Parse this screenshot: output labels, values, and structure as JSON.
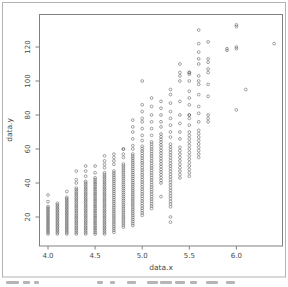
{
  "colors": {
    "point_stroke": "#5a5a5a",
    "axis_line": "#808080",
    "tick_text": "#4a4a4a",
    "outer_border": "#b3b3b3",
    "background": "#ffffff"
  },
  "footer": {
    "caption_cropped": true
  },
  "chart_data": {
    "type": "scatter",
    "title": "",
    "xlabel": "data.x",
    "ylabel": "data.y",
    "marker": "open-circle",
    "grid": false,
    "legend": "none",
    "xlim": [
      3.9,
      6.5
    ],
    "ylim": [
      3,
      139
    ],
    "x_ticks": [
      4.0,
      4.5,
      5.0,
      5.5,
      6.0
    ],
    "x_tick_labels": [
      "4.0",
      "4.5",
      "5.0",
      "5.5",
      "6.0"
    ],
    "y_ticks": [
      20,
      40,
      60,
      80,
      100,
      120
    ],
    "y_tick_labels": [
      "20",
      "40",
      "60",
      "80",
      "100",
      "120"
    ],
    "columns_note": "dense_range = overplotted vertical run of points sampled every `step` y-units; points = individually visible points",
    "columns": [
      {
        "x": 4.0,
        "dense_range": [
          10,
          27
        ],
        "step": 0.9,
        "points": [
          29,
          33
        ]
      },
      {
        "x": 4.1,
        "dense_range": [
          10,
          28
        ],
        "step": 0.9,
        "points": []
      },
      {
        "x": 4.2,
        "dense_range": [
          10,
          32
        ],
        "step": 0.9,
        "points": [
          35
        ]
      },
      {
        "x": 4.3,
        "dense_range": [
          10,
          37
        ],
        "step": 1.0,
        "points": [
          40,
          42,
          47
        ]
      },
      {
        "x": 4.4,
        "dense_range": [
          10,
          41
        ],
        "step": 1.0,
        "points": [
          44,
          47,
          50
        ]
      },
      {
        "x": 4.5,
        "dense_range": [
          10,
          43
        ],
        "step": 1.0,
        "points": [
          46,
          50
        ]
      },
      {
        "x": 4.6,
        "dense_range": [
          10,
          46
        ],
        "step": 1.0,
        "points": [
          49,
          51,
          53,
          56
        ]
      },
      {
        "x": 4.7,
        "dense_range": [
          11,
          48
        ],
        "step": 1.2,
        "points": [
          51,
          53,
          55,
          57
        ]
      },
      {
        "x": 4.8,
        "dense_range": [
          14,
          52
        ],
        "step": 1.2,
        "points": [
          55,
          57,
          60,
          60
        ]
      },
      {
        "x": 4.9,
        "dense_range": [
          15,
          58
        ],
        "step": 1.2,
        "points": [
          60,
          62,
          66,
          70,
          73,
          77
        ]
      },
      {
        "x": 5.0,
        "dense_range": [
          21,
          62
        ],
        "step": 1.4,
        "points": [
          65,
          68,
          72,
          76,
          78,
          82,
          86,
          100
        ]
      },
      {
        "x": 5.1,
        "dense_range": [
          25,
          65
        ],
        "step": 1.4,
        "points": [
          68,
          72,
          76,
          80,
          85,
          90
        ]
      },
      {
        "x": 5.2,
        "dense_range": [
          40,
          70
        ],
        "step": 1.6,
        "points": [
          32,
          73,
          76,
          80,
          84,
          88
        ]
      },
      {
        "x": 5.3,
        "dense_range": [
          26,
          63
        ],
        "step": 1.6,
        "points": [
          17,
          20,
          67,
          70,
          74,
          78,
          82,
          87,
          92,
          95
        ]
      },
      {
        "x": 5.4,
        "dense_range": [
          43,
          62
        ],
        "step": 2.0,
        "points": [
          66,
          70,
          75,
          80,
          88,
          100,
          103,
          105,
          110
        ]
      },
      {
        "x": 5.5,
        "dense_range": [
          44,
          70
        ],
        "step": 2.0,
        "points": [
          74,
          78,
          80,
          80,
          86,
          90,
          94,
          100,
          104,
          105,
          105
        ]
      },
      {
        "x": 5.6,
        "dense_range": [
          55,
          72
        ],
        "step": 2.0,
        "points": [
          76,
          81,
          85,
          92,
          98,
          100,
          103,
          110,
          113,
          117,
          122,
          130
        ]
      },
      {
        "x": 5.7,
        "dense_range": null,
        "step": 0,
        "points": [
          76,
          78,
          80,
          91,
          98,
          105,
          107,
          111,
          113,
          123
        ]
      },
      {
        "x": 5.9,
        "dense_range": null,
        "step": 0,
        "points": [
          118,
          119
        ]
      },
      {
        "x": 6.0,
        "dense_range": null,
        "step": 0,
        "points": [
          83,
          119,
          120,
          132,
          133
        ]
      },
      {
        "x": 6.1,
        "dense_range": null,
        "step": 0,
        "points": [
          95
        ]
      },
      {
        "x": 6.4,
        "dense_range": null,
        "step": 0,
        "points": [
          122
        ]
      }
    ]
  }
}
